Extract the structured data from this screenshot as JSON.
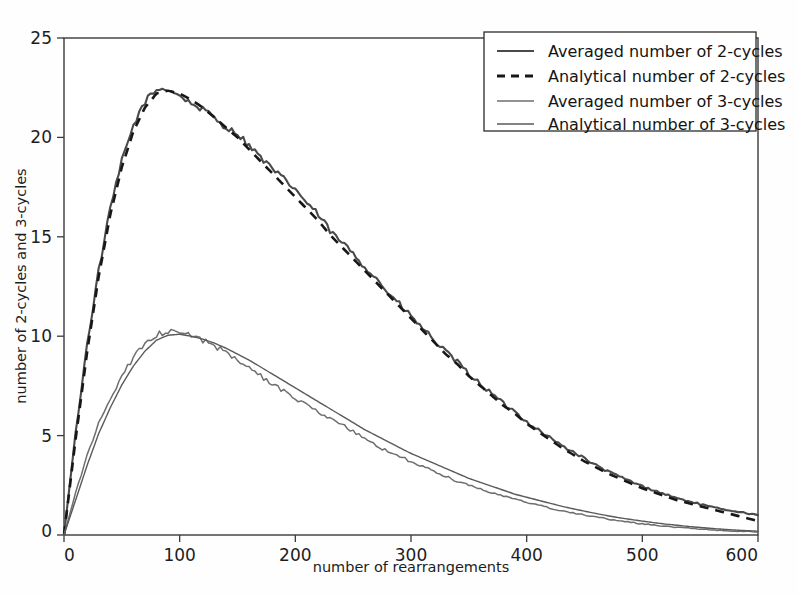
{
  "chart_data": {
    "type": "line",
    "title": "",
    "xlabel": "number of rearrangements",
    "ylabel": "number of 2-cycles and 3-cycles",
    "xlim": [
      0,
      600
    ],
    "ylim": [
      0,
      25
    ],
    "xticks": [
      0,
      100,
      200,
      300,
      400,
      500,
      600
    ],
    "yticks": [
      0,
      5,
      10,
      15,
      20,
      25
    ],
    "xtick_labels": [
      "0",
      "100",
      "200",
      "300",
      "400",
      "500",
      "600"
    ],
    "ytick_labels": [
      "0",
      "5",
      "10",
      "15",
      "20",
      "25"
    ],
    "grid": false,
    "legend_position": "upper right",
    "legend_entries": [
      "Averaged number of 2-cycles",
      "Analytical number of 2-cycles",
      "Averaged number of 3-cycles",
      "Analytical number of 3-cycles"
    ],
    "x": [
      0,
      10,
      20,
      30,
      40,
      50,
      60,
      70,
      80,
      90,
      100,
      110,
      120,
      130,
      140,
      150,
      160,
      170,
      180,
      190,
      200,
      210,
      220,
      230,
      240,
      250,
      260,
      270,
      280,
      290,
      300,
      310,
      320,
      330,
      340,
      350,
      360,
      370,
      380,
      390,
      400,
      410,
      420,
      430,
      440,
      450,
      460,
      470,
      480,
      490,
      500,
      510,
      520,
      530,
      540,
      550,
      560,
      570,
      580,
      590,
      600
    ],
    "series": [
      {
        "name": "Averaged number of 2-cycles",
        "style": "solid",
        "color": "#4a4a4a",
        "values": [
          0.0,
          5.1,
          9.6,
          13.3,
          16.4,
          18.8,
          20.6,
          21.8,
          22.4,
          22.45,
          22.1,
          21.7,
          21.4,
          21.0,
          20.5,
          20.2,
          19.6,
          19.0,
          18.4,
          17.9,
          17.4,
          16.7,
          16.1,
          15.3,
          14.7,
          14.2,
          13.5,
          12.9,
          12.2,
          11.6,
          11.0,
          10.4,
          9.8,
          9.2,
          8.7,
          8.1,
          7.6,
          7.1,
          6.6,
          6.2,
          5.7,
          5.3,
          4.9,
          4.5,
          4.2,
          3.85,
          3.5,
          3.2,
          2.95,
          2.7,
          2.45,
          2.25,
          2.05,
          1.85,
          1.7,
          1.55,
          1.4,
          1.3,
          1.2,
          1.1,
          1.0
        ]
      },
      {
        "name": "Analytical number of 2-cycles",
        "style": "dashed",
        "color": "#171717",
        "values": [
          0.0,
          4.8,
          9.2,
          13.0,
          16.1,
          18.5,
          20.3,
          21.5,
          22.2,
          22.35,
          22.2,
          21.9,
          21.5,
          21.0,
          20.5,
          20.0,
          19.4,
          18.8,
          18.2,
          17.6,
          17.0,
          16.4,
          15.8,
          15.1,
          14.5,
          13.9,
          13.3,
          12.7,
          12.1,
          11.5,
          10.9,
          10.3,
          9.7,
          9.1,
          8.6,
          8.0,
          7.5,
          7.0,
          6.5,
          6.1,
          5.6,
          5.2,
          4.8,
          4.4,
          4.05,
          3.7,
          3.4,
          3.1,
          2.85,
          2.6,
          2.35,
          2.15,
          1.95,
          1.75,
          1.6,
          1.45,
          1.3,
          1.15,
          1.0,
          0.85,
          0.7
        ]
      },
      {
        "name": "Averaged number of 3-cycles",
        "style": "solid",
        "color": "#6e6e6e",
        "values": [
          0.0,
          2.1,
          4.0,
          5.6,
          6.9,
          8.0,
          8.9,
          9.6,
          10.1,
          10.2,
          10.15,
          10.0,
          9.8,
          9.5,
          9.2,
          8.8,
          8.4,
          8.0,
          7.6,
          7.25,
          6.9,
          6.5,
          6.15,
          5.85,
          5.55,
          5.2,
          4.85,
          4.5,
          4.2,
          3.95,
          3.7,
          3.45,
          3.2,
          2.95,
          2.7,
          2.5,
          2.3,
          2.1,
          1.95,
          1.8,
          1.65,
          1.5,
          1.35,
          1.2,
          1.1,
          1.0,
          0.9,
          0.8,
          0.72,
          0.64,
          0.56,
          0.5,
          0.44,
          0.38,
          0.34,
          0.3,
          0.26,
          0.22,
          0.2,
          0.17,
          0.15
        ]
      },
      {
        "name": "Analytical number of 3-cycles",
        "style": "solid",
        "color": "#5a5a5a",
        "values": [
          0.0,
          1.75,
          3.5,
          5.1,
          6.4,
          7.55,
          8.5,
          9.25,
          9.8,
          10.05,
          10.1,
          10.0,
          9.85,
          9.65,
          9.4,
          9.1,
          8.8,
          8.45,
          8.1,
          7.75,
          7.4,
          7.05,
          6.7,
          6.35,
          6.0,
          5.65,
          5.3,
          5.0,
          4.7,
          4.4,
          4.1,
          3.85,
          3.6,
          3.35,
          3.1,
          2.85,
          2.65,
          2.45,
          2.25,
          2.05,
          1.9,
          1.75,
          1.6,
          1.45,
          1.32,
          1.2,
          1.08,
          0.97,
          0.87,
          0.78,
          0.7,
          0.62,
          0.55,
          0.49,
          0.43,
          0.38,
          0.33,
          0.29,
          0.25,
          0.22,
          0.19
        ]
      }
    ]
  }
}
